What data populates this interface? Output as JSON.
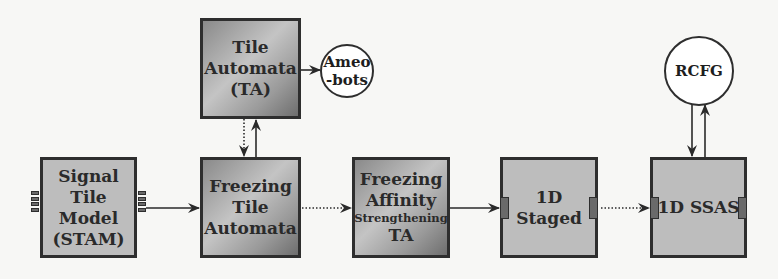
{
  "diagram": {
    "nodes": {
      "ta": {
        "lines": [
          "Tile",
          "Automata",
          "(TA)"
        ]
      },
      "ameobots": {
        "lines": [
          "Ameo",
          "-bots"
        ]
      },
      "stam": {
        "lines": [
          "Signal",
          "Tile",
          "Model",
          "(STAM)"
        ]
      },
      "freezing_ta": {
        "lines": [
          "Freezing",
          "Tile",
          "Automata"
        ]
      },
      "fas_ta": {
        "lines": [
          "Freezing",
          "Affinity",
          "Strengthening",
          "TA"
        ]
      },
      "staged_1d": {
        "lines": [
          "1D",
          "Staged"
        ]
      },
      "ssas_1d": {
        "lines": [
          "1D SSAS"
        ]
      },
      "rcfg": {
        "lines": [
          "RCFG"
        ]
      }
    },
    "edges": [
      {
        "from": "Tile Automata (TA)",
        "to": "Ameo-bots",
        "style": "solid"
      },
      {
        "from": "Freezing Tile Automata",
        "to": "Tile Automata (TA)",
        "style": "solid"
      },
      {
        "from": "Tile Automata (TA)",
        "to": "Freezing Tile Automata",
        "style": "dotted"
      },
      {
        "from": "Signal Tile Model (STAM)",
        "to": "Freezing Tile Automata",
        "style": "solid"
      },
      {
        "from": "Freezing Tile Automata",
        "to": "Freezing Affinity Strengthening TA",
        "style": "dotted"
      },
      {
        "from": "Freezing Affinity Strengthening TA",
        "to": "1D Staged",
        "style": "solid"
      },
      {
        "from": "1D Staged",
        "to": "1D SSAS",
        "style": "dotted"
      },
      {
        "from": "RCFG",
        "to": "1D SSAS",
        "style": "solid"
      },
      {
        "from": "1D SSAS",
        "to": "RCFG",
        "style": "solid"
      }
    ],
    "colors": {
      "stroke": "#2e2e2e",
      "flat_fill": "#bdbdbd",
      "circle_fill": "#ffffff",
      "port_fill": "#6a6a6a"
    }
  }
}
